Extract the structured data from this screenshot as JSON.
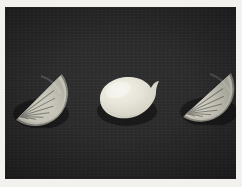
{
  "scene": {
    "title": "Lemon still life",
    "description": "Two citrus wedges flanking one whole lemon on a dark slate surface",
    "frame_border_color": "#f2f1ee",
    "background_color": "#262626",
    "background_texture": "slate-fabric",
    "object_count": "3"
  },
  "palette": {
    "backdrop_dark": "#262626",
    "backdrop_light": "#2f2e2e",
    "rind_outer": "#8e8d86",
    "rind_pith": "#cfcdc2",
    "flesh_light": "#d9d7cc",
    "flesh_mid": "#c6c4b8",
    "segment_line": "#6f6e66",
    "lemon_body": "#e6e4d8",
    "lemon_highlight": "#f3f1e7",
    "lemon_shadow": "#cbc9bd",
    "drop_shadow": "rgba(0,0,0,0.45)"
  },
  "objects": [
    {
      "id": "wedge-left",
      "name": "Citrus wedge, left",
      "type": "half-slice",
      "segments": "8",
      "orientation": "cut edge facing upper-left",
      "bbox": "12,72,50,40"
    },
    {
      "id": "lemon-center",
      "name": "Whole lemon",
      "type": "whole-fruit",
      "segments": "0",
      "orientation": "stem nub pointing right",
      "bbox": "95,70,57,45"
    },
    {
      "id": "wedge-right",
      "name": "Citrus wedge, right",
      "type": "half-slice",
      "segments": "8",
      "orientation": "cut edge facing upper-left",
      "bbox": "178,70,54,42"
    }
  ]
}
